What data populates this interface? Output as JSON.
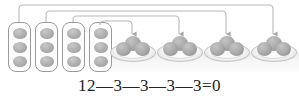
{
  "illustration": {
    "title": "subtraction-grouping-illustration",
    "colors": {
      "background": "#ffffff",
      "box_border": "#9a9a9a",
      "dot_fill": "#a8a8a8",
      "ball_fill": "#a0a0a0",
      "plate_rim": "#c4c4c4",
      "surface": "#eeeeee",
      "arrow_stroke": "#b4b4b4",
      "text": "#232323"
    },
    "source_groups": {
      "label": "groups-of-three",
      "count": 4,
      "dots_per_group": 3,
      "items": [
        {
          "index": 1,
          "dots": 3,
          "x": 8
        },
        {
          "index": 2,
          "dots": 3,
          "x": 35
        },
        {
          "index": 3,
          "dots": 3,
          "x": 62
        },
        {
          "index": 4,
          "dots": 3,
          "x": 89
        }
      ]
    },
    "target_plates": {
      "label": "plates-of-three",
      "count": 4,
      "balls_per_plate": 3,
      "items": [
        {
          "index": 1,
          "balls": 3,
          "x": 110
        },
        {
          "index": 2,
          "balls": 3,
          "x": 157
        },
        {
          "index": 3,
          "balls": 3,
          "x": 204
        },
        {
          "index": 4,
          "balls": 3,
          "x": 251
        }
      ]
    },
    "arrows": {
      "label": "mapping-arrows",
      "count": 4,
      "paths": [
        {
          "index": 1,
          "from_x": 19,
          "to_x": 273,
          "top_y": 5,
          "tip_y": 36
        },
        {
          "index": 2,
          "from_x": 46,
          "to_x": 226,
          "top_y": 11,
          "tip_y": 36
        },
        {
          "index": 3,
          "from_x": 73,
          "to_x": 179,
          "top_y": 16,
          "tip_y": 36
        },
        {
          "index": 4,
          "from_x": 100,
          "to_x": 132,
          "top_y": 21,
          "tip_y": 36
        }
      ]
    },
    "equation": {
      "text": "12—3—3—3—3=0",
      "minuend": 12,
      "subtrahends": [
        3,
        3,
        3,
        3
      ],
      "result": 0
    }
  }
}
